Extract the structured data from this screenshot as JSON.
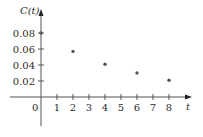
{
  "chart_data": {
    "type": "scatter",
    "title": "",
    "xlabel": "t",
    "ylabel": "C(t)",
    "x": [
      0,
      2,
      4,
      6,
      8
    ],
    "series": [
      {
        "name": "C(t)",
        "values": [
          0.08,
          0.057,
          0.041,
          0.03,
          0.021
        ]
      }
    ],
    "x_ticks": [
      "1",
      "2",
      "3",
      "4",
      "5",
      "6",
      "7",
      "8"
    ],
    "y_ticks": [
      "0.02",
      "0.04",
      "0.06",
      "0.08"
    ],
    "origin_label": "0",
    "xlim": [
      -2.5,
      9.5
    ],
    "ylim": [
      -0.035,
      0.1
    ],
    "grid": false,
    "legend": null
  },
  "style": {
    "axis_color": "#555555",
    "point_color": "#555555",
    "text_color": "#2b2b2b"
  }
}
